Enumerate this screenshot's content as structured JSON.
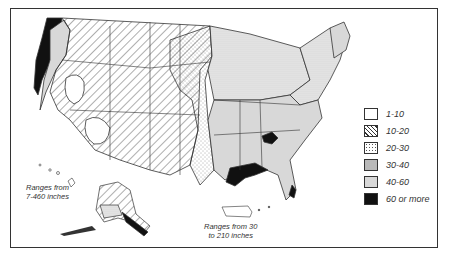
{
  "map": {
    "title": "",
    "subject": "Average annual precipitation (inches), United States"
  },
  "legend": {
    "items": [
      {
        "label": "1-10",
        "pattern": "blank",
        "fill": "#ffffff"
      },
      {
        "label": "10-20",
        "pattern": "diagonal-hatch",
        "fill": "#ffffff"
      },
      {
        "label": "20-30",
        "pattern": "sparse-dots",
        "fill": "#ffffff"
      },
      {
        "label": "30-40",
        "pattern": "dense-dots",
        "fill": "#ececec"
      },
      {
        "label": "40-60",
        "pattern": "light-gray",
        "fill": "#d8d8d8"
      },
      {
        "label": "60 or more",
        "pattern": "solid-black",
        "fill": "#111111"
      }
    ]
  },
  "notes": {
    "hawaii": {
      "line1": "Ranges from",
      "line2": "7-460 inches"
    },
    "puerto_rico": {
      "line1": "Ranges from 30",
      "line2": "to 210 inches"
    }
  },
  "colors": {
    "border": "#333333",
    "text": "#333333",
    "black_region": "#111111",
    "gray_region": "#d8d8d8"
  }
}
